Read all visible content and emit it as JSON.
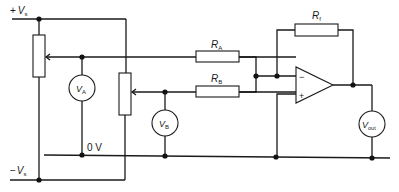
{
  "diagram": {
    "supplies": {
      "positive": {
        "sign": "+",
        "symbol": "V",
        "subscript": "s"
      },
      "negative": {
        "sign": "−",
        "symbol": "V",
        "subscript": "s"
      },
      "ground": "0 V"
    },
    "resistors": [
      {
        "id": "RA",
        "symbol": "R",
        "subscript": "A"
      },
      {
        "id": "RB",
        "symbol": "R",
        "subscript": "B"
      },
      {
        "id": "Rf",
        "symbol": "R",
        "subscript": "f"
      }
    ],
    "meters": [
      {
        "id": "VA",
        "symbol": "V",
        "subscript": "A"
      },
      {
        "id": "VB",
        "symbol": "V",
        "subscript": "B"
      },
      {
        "id": "Vout",
        "symbol": "V",
        "subscript": "out"
      }
    ],
    "opamp": {
      "inverting": "−",
      "noninverting": "+"
    }
  }
}
